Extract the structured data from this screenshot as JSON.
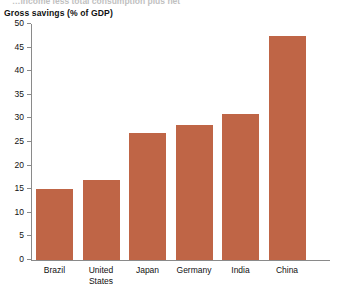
{
  "caption_cutoff": "…income less total consumption plus net",
  "axis_title": "Gross savings (% of GDP)",
  "colors": {
    "bar": "#bf6546",
    "axis": "#8a8a8a",
    "text": "#111111",
    "background": "#ffffff"
  },
  "chart_data": {
    "type": "bar",
    "title": "Gross savings (% of GDP)",
    "xlabel": "",
    "ylabel": "Gross savings (% of GDP)",
    "categories": [
      "Brazil",
      "United States",
      "Japan",
      "Germany",
      "India",
      "China"
    ],
    "values": [
      15,
      17,
      27,
      28.5,
      31,
      47.5
    ],
    "ylim": [
      0,
      50
    ],
    "yticks": [
      0,
      5,
      10,
      15,
      20,
      25,
      30,
      35,
      40,
      45,
      50
    ],
    "ytick_labels": [
      "0",
      "5",
      "10",
      "15",
      "20",
      "25",
      "30",
      "35",
      "40",
      "45",
      "50"
    ],
    "grid": false,
    "legend": null,
    "series": [
      {
        "name": "Gross savings (% of GDP)",
        "values": [
          15,
          17,
          27,
          28.5,
          31,
          47.5
        ]
      }
    ]
  }
}
